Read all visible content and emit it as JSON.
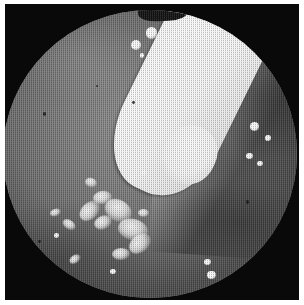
{
  "image": {
    "kind": "endoscopic-photograph",
    "modality": "White-light endoscopy",
    "capture_style": "Halftone-screened grayscale print reproduction",
    "field_of_view": "circular",
    "palette": {
      "print_margin": "#ffffff",
      "mask_black": "#090909",
      "mucosa_light": "#8d8d8d",
      "mucosa_mid": "#6e6e6e",
      "mucosa_dark": "#4a4a4a",
      "lesion_black": "#0d0d0d",
      "instrument_white": "#ffffff",
      "exudate_white": "#f7f7f7"
    },
    "alt_text": "Grayscale endoscopic view showing mucosal surface with a white instrument entering from the upper right, a dark central orifice or lesion, and scattered bright exudate patches in the lower left."
  },
  "scene": {
    "instrument": {
      "label": "Endoscopic instrument",
      "entry": "upper-right",
      "tone": "bright white",
      "shape": "tapered wedge with rounded tip"
    },
    "lesion": {
      "label": "Dark central orifice / lesion",
      "position": "center",
      "tone": "near-black"
    },
    "ridge": {
      "label": "Mucosal fold / ridge",
      "position": "right"
    },
    "exudate": {
      "label": "Exudate and mucus patches",
      "position": "lower-left quadrant"
    },
    "highlights": {
      "label": "Specular highlights / bubbles",
      "count": 21
    }
  },
  "exudate_patches": [
    {
      "left": "25.5%",
      "top": "67.0%",
      "width": "7.8%",
      "height": "5.4%"
    },
    {
      "left": "30.5%",
      "top": "63.0%",
      "width": "6.4%",
      "height": "4.6%"
    },
    {
      "left": "34.5%",
      "top": "66.0%",
      "width": "9.6%",
      "height": "7.4%"
    },
    {
      "left": "31.0%",
      "top": "71.5%",
      "width": "6.0%",
      "height": "4.4%"
    },
    {
      "left": "39.0%",
      "top": "72.5%",
      "width": "10.2%",
      "height": "7.2%"
    },
    {
      "left": "42.5%",
      "top": "78.0%",
      "width": "8.2%",
      "height": "6.0%"
    },
    {
      "left": "37.0%",
      "top": "82.5%",
      "width": "6.2%",
      "height": "4.2%"
    },
    {
      "left": "20.0%",
      "top": "73.0%",
      "width": "4.6%",
      "height": "3.2%"
    },
    {
      "left": "16.0%",
      "top": "69.0%",
      "width": "3.6%",
      "height": "2.6%"
    },
    {
      "left": "28.0%",
      "top": "58.5%",
      "width": "4.0%",
      "height": "3.0%"
    },
    {
      "left": "22.5%",
      "top": "85.0%",
      "width": "4.2%",
      "height": "2.8%"
    },
    {
      "left": "46.0%",
      "top": "69.0%",
      "width": "3.8%",
      "height": "2.8%"
    }
  ],
  "specular_spots": [
    {
      "left": "48.5%",
      "top": "6.0%",
      "size": "4.0%"
    },
    {
      "left": "54.5%",
      "top": "5.0%",
      "size": "3.0%"
    },
    {
      "left": "57.5%",
      "top": "8.5%",
      "size": "2.4%"
    },
    {
      "left": "61.0%",
      "top": "6.5%",
      "size": "3.2%"
    },
    {
      "left": "43.5%",
      "top": "10.5%",
      "size": "3.4%"
    },
    {
      "left": "51.5%",
      "top": "11.5%",
      "size": "2.0%"
    },
    {
      "left": "46.5%",
      "top": "15.0%",
      "size": "1.6%"
    },
    {
      "left": "50.0%",
      "top": "24.5%",
      "size": "2.0%"
    },
    {
      "left": "42.0%",
      "top": "41.5%",
      "size": "2.6%"
    },
    {
      "left": "47.0%",
      "top": "55.5%",
      "size": "2.0%"
    },
    {
      "left": "84.0%",
      "top": "39.0%",
      "size": "3.0%"
    },
    {
      "left": "89.0%",
      "top": "43.5%",
      "size": "2.0%"
    },
    {
      "left": "82.5%",
      "top": "49.5%",
      "size": "2.4%"
    },
    {
      "left": "86.5%",
      "top": "52.5%",
      "size": "1.8%"
    },
    {
      "left": "68.5%",
      "top": "86.5%",
      "size": "2.2%"
    },
    {
      "left": "69.5%",
      "top": "90.5%",
      "size": "3.0%"
    },
    {
      "left": "36.5%",
      "top": "90.0%",
      "size": "1.8%"
    },
    {
      "left": "17.5%",
      "top": "77.5%",
      "size": "1.6%"
    }
  ],
  "dark_specks": [
    {
      "left": "13.5%",
      "top": "35.5%",
      "size": "1.2%"
    },
    {
      "left": "44.0%",
      "top": "31.5%",
      "size": "1.0%"
    },
    {
      "left": "82.5%",
      "top": "66.0%",
      "size": "1.2%"
    },
    {
      "left": "12.0%",
      "top": "80.0%",
      "size": "1.0%"
    },
    {
      "left": "31.5%",
      "top": "26.0%",
      "size": "0.9%"
    }
  ]
}
